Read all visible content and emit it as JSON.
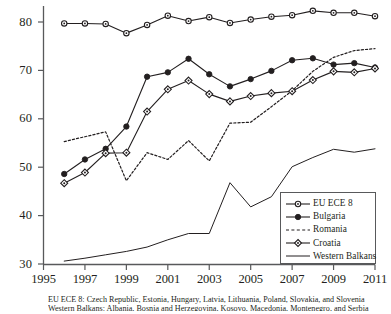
{
  "chart_data": {
    "type": "line",
    "title": "",
    "subtitle": "",
    "xlabel": "",
    "ylabel": "",
    "xlim": [
      1995,
      2011
    ],
    "ylim": [
      30,
      80
    ],
    "yticks": [
      30,
      40,
      50,
      60,
      70,
      80
    ],
    "xticks": [
      1995,
      1997,
      1999,
      2001,
      2003,
      2005,
      2007,
      2009,
      2011
    ],
    "grid": false,
    "legend_position": "lower-right",
    "series": [
      {
        "name": "EU ECE 8",
        "marker": "open-circle",
        "line": "solid",
        "color": "#231f20",
        "x": [
          1996,
          1997,
          1998,
          1999,
          2000,
          2001,
          2002,
          2003,
          2004,
          2005,
          2006,
          2007,
          2008,
          2009,
          2010,
          2011
        ],
        "values": [
          79.7,
          79.7,
          79.6,
          77.7,
          79.4,
          81.3,
          80.2,
          81.0,
          79.8,
          80.5,
          81.1,
          81.4,
          82.3,
          81.9,
          81.9,
          81.2
        ]
      },
      {
        "name": "Bulgaria",
        "marker": "filled-circle",
        "line": "solid",
        "color": "#231f20",
        "x": [
          1996,
          1997,
          1998,
          1999,
          2000,
          2001,
          2002,
          2003,
          2004,
          2005,
          2006,
          2007,
          2008,
          2009,
          2010,
          2011
        ],
        "values": [
          48.6,
          51.6,
          53.8,
          58.4,
          68.7,
          69.6,
          72.4,
          69.2,
          66.7,
          68.2,
          69.9,
          72.1,
          72.5,
          71.2,
          71.5,
          70.6
        ]
      },
      {
        "name": "Romania",
        "marker": "none",
        "line": "dashed",
        "color": "#231f20",
        "x": [
          1996,
          1997,
          1998,
          1999,
          2000,
          2001,
          2002,
          2003,
          2004,
          2005,
          2006,
          2007,
          2008,
          2009,
          2010,
          2011
        ],
        "values": [
          55.3,
          56.3,
          57.3,
          47.2,
          53.0,
          51.6,
          55.5,
          51.3,
          59.1,
          59.3,
          62.5,
          65.8,
          69.8,
          72.7,
          74.1,
          74.5
        ]
      },
      {
        "name": "Croatia",
        "marker": "open-diamond",
        "line": "solid",
        "color": "#231f20",
        "x": [
          1996,
          1997,
          1998,
          1999,
          2000,
          2001,
          2002,
          2003,
          2004,
          2005,
          2006,
          2007,
          2008,
          2009,
          2010,
          2011
        ],
        "values": [
          46.7,
          48.9,
          52.9,
          53.0,
          61.5,
          66.1,
          67.9,
          65.1,
          63.6,
          64.7,
          65.3,
          65.7,
          68.0,
          69.8,
          69.6,
          70.4
        ]
      },
      {
        "name": "Western Balkans",
        "marker": "none",
        "line": "solid",
        "color": "#231f20",
        "x": [
          1996,
          1997,
          1998,
          1999,
          2000,
          2001,
          2002,
          2003,
          2004,
          2005,
          2006,
          2007,
          2008,
          2009,
          2010,
          2011
        ],
        "values": [
          30.6,
          31.2,
          31.9,
          32.6,
          33.5,
          35.0,
          36.3,
          36.3,
          46.8,
          41.8,
          43.9,
          50.1,
          52.0,
          53.7,
          53.1,
          53.8
        ]
      }
    ]
  },
  "axis": {
    "y_labels": [
      "80",
      "70",
      "60",
      "50",
      "40",
      "30"
    ],
    "x_labels": [
      "1995",
      "1997",
      "1999",
      "2001",
      "2003",
      "2005",
      "2007",
      "2009",
      "2011"
    ]
  },
  "legend": {
    "items": [
      {
        "label": "EU ECE 8",
        "key": "line-open-circle"
      },
      {
        "label": "Bulgaria",
        "key": "line-filled-circle"
      },
      {
        "label": "Romania",
        "key": "line-dashed"
      },
      {
        "label": "Croatia",
        "key": "line-open-diamond"
      },
      {
        "label": "Western Balkans",
        "key": "line-plain"
      }
    ]
  },
  "footnote": {
    "line1": "EU ECE 8: Czech Republic, Estonia, Hungary, Latvia, Lithuania, Poland, Slovakia, and Slovenia",
    "line2": "Western Balkans: Albania, Bosnia and Herzegovina, Kosovo, Macedonia, Montenegro, and Serbia"
  }
}
